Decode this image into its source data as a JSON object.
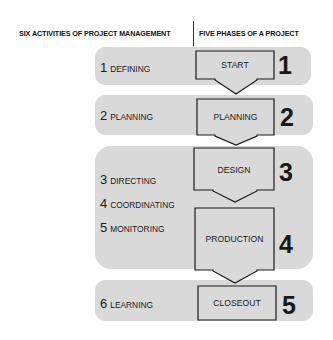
{
  "header": {
    "left_title": "SIX ACTIVITIES OF PROJECT MANAGEMENT",
    "right_title": "FIVE PHASES OF A PROJECT"
  },
  "activities": [
    {
      "num": "1",
      "label": "DEFINING"
    },
    {
      "num": "2",
      "label": "PLANNING"
    },
    {
      "num": "3",
      "label": "DIRECTING"
    },
    {
      "num": "4",
      "label": "COORDINATING"
    },
    {
      "num": "5",
      "label": "MONITORING"
    },
    {
      "num": "6",
      "label": "LEARNING"
    }
  ],
  "phases": [
    {
      "num": "1",
      "label": "START"
    },
    {
      "num": "2",
      "label": "PLANNING"
    },
    {
      "num": "3",
      "label": "DESIGN"
    },
    {
      "num": "4",
      "label": "PRODUCTION"
    },
    {
      "num": "5",
      "label": "CLOSEOUT"
    }
  ],
  "colors": {
    "band": "#d9d9d9",
    "box_fill": "#d9d9d9",
    "box_stroke": "#1a1a1a"
  }
}
